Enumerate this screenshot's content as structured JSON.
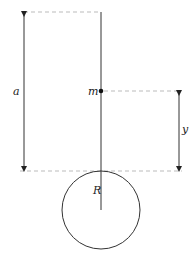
{
  "labels": {
    "a": "a",
    "m": "m",
    "y": "y",
    "R": "R"
  },
  "colors": {
    "line": "#333333",
    "dashed": "#bbbbbb",
    "background": "#ffffff"
  }
}
